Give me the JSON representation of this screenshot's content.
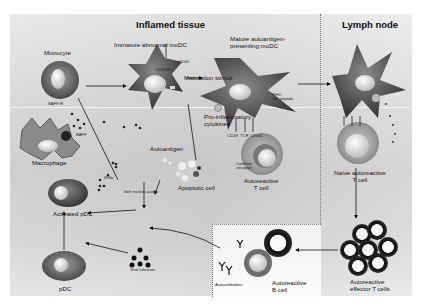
{
  "regions": {
    "inflamed_tissue": "Inflamed tissue",
    "lymph_node": "Lymph node"
  },
  "cells": {
    "monocyte": "Monocyte",
    "immature_modc": "Immature abnormal moDC",
    "mature_modc_line1": "Mature autoantigen-",
    "mature_modc_line2": "presenting moDC",
    "macrophage": "Macrophage",
    "apoptotic_cell": "Apoptotic cell",
    "activated_pdc": "Activated pDC",
    "pdc": "pDC",
    "autoreactive_t_line1": "Autoreactive",
    "autoreactive_t_line2": "T cell",
    "naive_t_line1": "Naïve autoreactive",
    "naive_t_line2": "T cell",
    "effector_t_line1": "Autoreactive",
    "effector_t_line2": "effector T cells",
    "b_cell_line1": "Autoreactive",
    "b_cell_line2": "B cell"
  },
  "molecules": {
    "baff_r": "BAFF-R",
    "baff": "BAFF",
    "cd40": "CD40",
    "cd80_86": "CD80/86",
    "mhc_line1": "MHC",
    "mhc_line2": "self peptide",
    "cd28": "CD28",
    "tcr": "TCR",
    "cd40l": "CD40L",
    "cytokine_receptor_line1": "Cytokine",
    "cytokine_receptor_line2": "receptor",
    "ifna": "IFNα",
    "self_nucleic_acids": "Self nucleic acids",
    "autoantigen": "Autoantigen",
    "autoantibodies": "Autoantibodies"
  },
  "processes": {
    "maturation_stimuli": "Maturation stimuli",
    "proinflammatory_line1": "Pro-inflammatory",
    "proinflammatory_line2": "cytokines",
    "viral_infection": "Viral infection"
  },
  "colors": {
    "background": "#d6d6d6",
    "cell_dark": "#3a3a3a",
    "cell_mid": "#6b6b6b",
    "nucleus": "#e8e8e8",
    "text": "#111111",
    "divider": "#7a7a7a"
  }
}
